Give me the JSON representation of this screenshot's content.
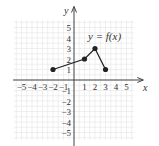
{
  "chart_data": {
    "type": "line",
    "title": "",
    "function_label": "y = f(x)",
    "xlabel": "x",
    "ylabel": "y",
    "xlim": [
      -5.8,
      6
    ],
    "ylim": [
      -5.5,
      6
    ],
    "grid": true,
    "x_ticks": [
      -5,
      -4,
      -3,
      -2,
      -1,
      1,
      2,
      3,
      4,
      5
    ],
    "y_ticks": [
      5,
      4,
      3,
      2,
      1,
      -1,
      -2,
      -3,
      -4,
      -5
    ],
    "series": [
      {
        "name": "f(x)",
        "x": [
          -2,
          1,
          2,
          3
        ],
        "y": [
          1,
          2,
          3,
          1
        ],
        "endpoints": "closed"
      }
    ]
  },
  "colors": {
    "axis": "#444444",
    "grid": "#e4e4e4",
    "line": "#222222",
    "point": "#222222"
  }
}
